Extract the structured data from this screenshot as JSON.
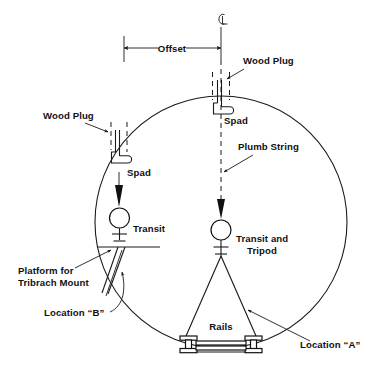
{
  "figure": {
    "width": 384,
    "height": 371,
    "background_color": "#ffffff",
    "line_color": "#1a1a1a"
  },
  "labels": {
    "centerline_symbol": "℄",
    "offset": "Offset",
    "wood_plug_top": "Wood Plug",
    "wood_plug_left": "Wood Plug",
    "spad_top": "Spad",
    "spad_left": "Spad",
    "plumb_string": "Plumb String",
    "transit": "Transit",
    "transit_and_tripod_line1": "Transit and",
    "transit_and_tripod_line2": "Tripod",
    "platform_line1": "Platform for",
    "platform_line2": "Tribrach Mount",
    "location_b": "Location “B”",
    "location_a": "Location “A”",
    "rails": "Rails"
  },
  "geometry": {
    "circle_center_x": 221,
    "circle_center_y": 222,
    "circle_radius": 126,
    "offset_left_x": 124,
    "offset_right_x": 221,
    "offset_y": 48
  }
}
